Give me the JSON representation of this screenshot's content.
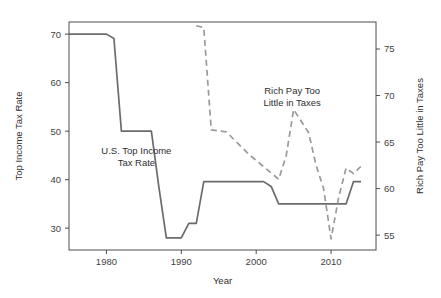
{
  "chart_data": {
    "type": "line",
    "title": "",
    "xlabel": "Year",
    "ylabel_left": "Top Income Tax Rate",
    "ylabel_right": "Rich Pay Too Little in Taxes",
    "grid": false,
    "legend_position": "none",
    "xlim": [
      1975,
      2016
    ],
    "xticks": [
      1980,
      1990,
      2000,
      2010
    ],
    "xtick_labels": [
      "1980",
      "1990",
      "2000",
      "2010"
    ],
    "ylim_left": [
      25.5,
      72.5
    ],
    "yticks_left": [
      30,
      40,
      50,
      60,
      70
    ],
    "ytick_labels_left": [
      "30",
      "40",
      "50",
      "60",
      "70"
    ],
    "ylim_right": [
      53.4,
      77.9
    ],
    "yticks_right": [
      55,
      60,
      65,
      70,
      75
    ],
    "ytick_labels_right": [
      "55",
      "60",
      "65",
      "70",
      "75"
    ],
    "annotations": [
      {
        "name": "us-top-income-tax-rate-label",
        "lines": [
          "U.S. Top Income",
          "Tax Rate"
        ],
        "x": 1984.0,
        "y_left": 45.2
      },
      {
        "name": "rich-pay-too-little-label",
        "lines": [
          "Rich Pay Too",
          "Little in Taxes"
        ],
        "x": 2004.8,
        "y_right": 70.2
      }
    ],
    "series": [
      {
        "name": "U.S. Top Income Tax Rate",
        "axis": "left",
        "style": "solid",
        "color": "#6b6b6b",
        "x": [
          1975,
          1976,
          1977,
          1978,
          1979,
          1980,
          1981,
          1982,
          1983,
          1984,
          1985,
          1986,
          1987,
          1988,
          1989,
          1990,
          1991,
          1992,
          1993,
          1994,
          1995,
          1996,
          1997,
          1998,
          1999,
          2000,
          2001,
          2002,
          2003,
          2004,
          2005,
          2006,
          2007,
          2008,
          2009,
          2010,
          2011,
          2012,
          2013,
          2014
        ],
        "values": [
          70,
          70,
          70,
          70,
          70,
          70,
          69.1,
          50,
          50,
          50,
          50,
          50,
          38.5,
          28,
          28,
          28,
          31,
          31,
          39.6,
          39.6,
          39.6,
          39.6,
          39.6,
          39.6,
          39.6,
          39.6,
          39.6,
          38.6,
          35,
          35,
          35,
          35,
          35,
          35,
          35,
          35,
          35,
          35,
          39.6,
          39.6
        ]
      },
      {
        "name": "Rich Pay Too Little in Taxes",
        "axis": "right",
        "style": "dashed",
        "color": "#9a9a9a",
        "x": [
          1992,
          1993,
          1994,
          1996,
          1999,
          2003,
          2004,
          2005,
          2007,
          2008,
          2009,
          2010,
          2011,
          2012,
          2013,
          2014
        ],
        "values": [
          77.5,
          77.3,
          66.3,
          66.1,
          63.7,
          61.0,
          63.5,
          68.5,
          66.0,
          62.5,
          60.0,
          54.6,
          59.0,
          62.2,
          61.6,
          62.4
        ]
      }
    ]
  },
  "axes": {
    "x_title": "Year",
    "y_left_title": "Top Income Tax Rate",
    "y_right_title": "Rich Pay Too Little in Taxes"
  }
}
